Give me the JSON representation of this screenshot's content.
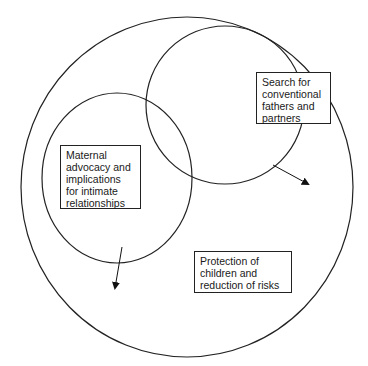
{
  "diagram": {
    "type": "nested-venn",
    "colors": {
      "stroke": "#222222",
      "background": "#ffffff",
      "text": "#1a1a1a"
    },
    "circles": [
      {
        "id": "outer",
        "cx": 187,
        "cy": 187,
        "rx": 166,
        "ry": 170
      },
      {
        "id": "upper-right",
        "cx": 225,
        "cy": 105,
        "rx": 79,
        "ry": 79
      },
      {
        "id": "left",
        "cx": 117,
        "cy": 178,
        "rx": 75,
        "ry": 85
      }
    ],
    "labels": {
      "search": {
        "lines": [
          "Search for",
          "conventional",
          "fathers and",
          "partners"
        ]
      },
      "maternal": {
        "lines": [
          "Maternal",
          "advocacy and",
          "implications",
          "for intimate",
          "relationships"
        ]
      },
      "protection": {
        "lines": [
          "Protection of",
          "children and",
          "reduction of risks"
        ]
      }
    },
    "arrows": [
      {
        "id": "search-arrow",
        "from": [
          273,
          165
        ],
        "to": [
          310,
          185
        ]
      },
      {
        "id": "maternal-arrow",
        "from": [
          122,
          247
        ],
        "to": [
          115,
          290
        ]
      }
    ]
  }
}
